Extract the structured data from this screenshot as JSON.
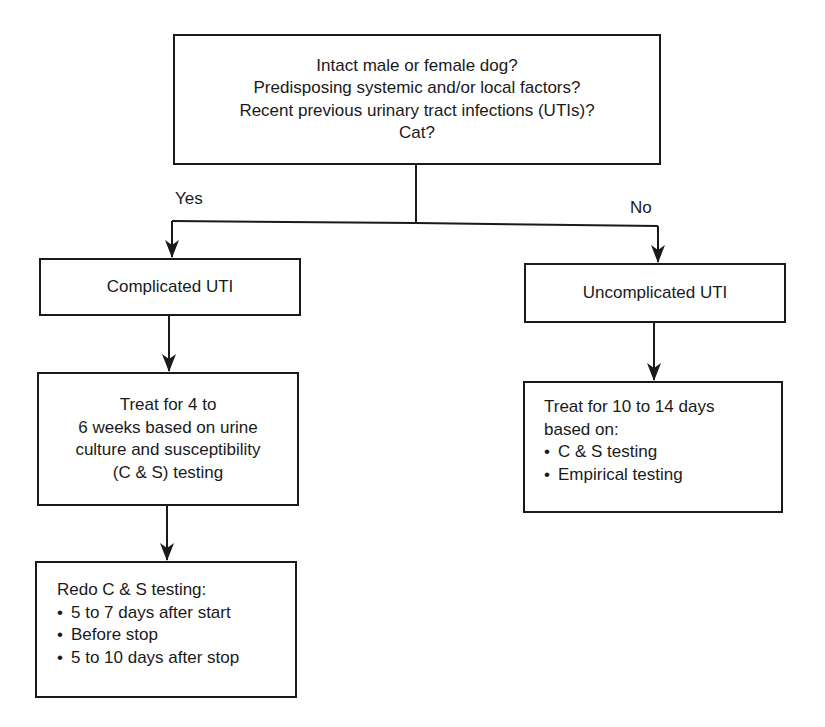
{
  "diagram": {
    "type": "flowchart",
    "colors": {
      "stroke": "#1a1a1a",
      "text": "#1a1a1a",
      "background": "#ffffff"
    },
    "question_box": {
      "lines": [
        "Intact male or female dog?",
        "Predisposing systemic and/or local factors?",
        "Recent previous urinary tract infections (UTIs)?",
        "Cat?"
      ]
    },
    "branches": {
      "yes_label": "Yes",
      "no_label": "No"
    },
    "complicated": {
      "title": "Complicated UTI",
      "treatment_lines": [
        "Treat for 4 to",
        "6 weeks based on urine",
        "culture and susceptibility",
        "(C & S) testing"
      ],
      "retest": {
        "heading": "Redo C & S testing:",
        "bullet_symbol": "•",
        "items": [
          "5 to 7 days after start",
          "Before stop",
          "5 to 10 days after stop"
        ]
      }
    },
    "uncomplicated": {
      "title": "Uncomplicated UTI",
      "treatment": {
        "heading_lines": [
          "Treat for 10 to 14 days",
          "based on:"
        ],
        "bullet_symbol": "•",
        "items": [
          "C & S testing",
          "Empirical testing"
        ]
      }
    },
    "edges": [
      {
        "from": "question_box",
        "to": "complicated.title",
        "label": "Yes"
      },
      {
        "from": "question_box",
        "to": "uncomplicated.title",
        "label": "No"
      },
      {
        "from": "complicated.title",
        "to": "complicated.treatment",
        "label": ""
      },
      {
        "from": "complicated.treatment",
        "to": "complicated.retest",
        "label": ""
      },
      {
        "from": "uncomplicated.title",
        "to": "uncomplicated.treatment",
        "label": ""
      }
    ]
  }
}
